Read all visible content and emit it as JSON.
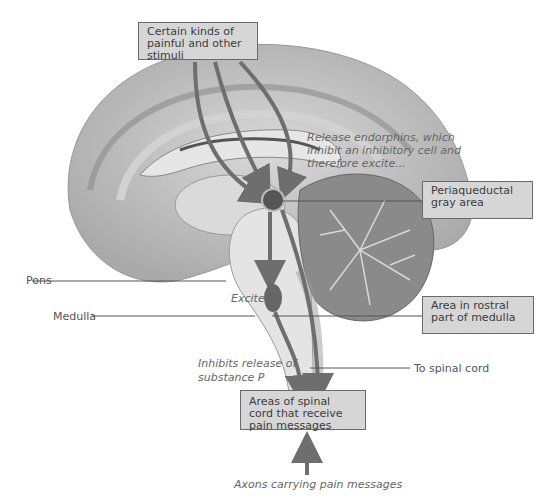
{
  "diagram": {
    "colors": {
      "arrow": "#6e6e6e",
      "node": "#555555",
      "box_fill": "#d6d6d6",
      "box_border": "#6a6a6a",
      "brain_tissue": "#bdbdbd",
      "leader_line": "#555555"
    },
    "boxes": {
      "stimuli": "Certain kinds of painful and other stimuli",
      "periaqueductal": "Periaqueductal gray area",
      "rostral_medulla": "Area in rostral part of medulla",
      "spinal_areas": "Areas of spinal cord that receive pain messages"
    },
    "labels": {
      "pons": "Pons",
      "medulla": "Medulla",
      "to_spinal_cord": "To spinal cord"
    },
    "annotations": {
      "endorphins_1": "Release endorphins, which",
      "endorphins_2": "inhibit an inhibitory cell and",
      "endorphins_3": "therefore excite...",
      "excites": "Excites",
      "inhibits_1": "Inhibits release of",
      "inhibits_2": "substance P",
      "axons": "Axons carrying pain messages"
    }
  }
}
